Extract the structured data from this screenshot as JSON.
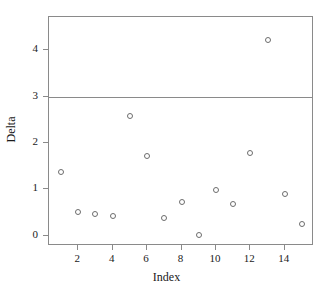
{
  "chart_data": {
    "type": "scatter",
    "title": "",
    "xlabel": "Index",
    "ylabel": "Delta",
    "xlim": [
      0.3,
      15.7
    ],
    "ylim": [
      -0.22,
      4.72
    ],
    "grid": false,
    "legend": null,
    "xticks": [
      2,
      4,
      6,
      8,
      10,
      12,
      14
    ],
    "xtick_labels": [
      "2",
      "4",
      "6",
      "8",
      "10",
      "12",
      "14"
    ],
    "yticks": [
      0,
      1,
      2,
      3,
      4
    ],
    "ytick_labels": [
      "0",
      "1",
      "2",
      "3",
      "4"
    ],
    "marker": "open-circle",
    "marker_color": "#6d6d6d",
    "frame_color": "#8a8a8a",
    "reference_lines": [
      {
        "axis": "y",
        "value": 3,
        "color": "#8a8a8a",
        "label": ""
      }
    ],
    "x": [
      1,
      2,
      3,
      4,
      5,
      6,
      7,
      8,
      9,
      10,
      11,
      12,
      13,
      14,
      15
    ],
    "y": [
      1.38,
      0.51,
      0.47,
      0.42,
      2.59,
      1.72,
      0.38,
      0.72,
      0.02,
      0.98,
      0.68,
      1.78,
      4.22,
      0.91,
      0.26
    ],
    "points": [
      {
        "x": 1,
        "y": 1.38
      },
      {
        "x": 2,
        "y": 0.51
      },
      {
        "x": 3,
        "y": 0.47
      },
      {
        "x": 4,
        "y": 0.42
      },
      {
        "x": 5,
        "y": 2.59
      },
      {
        "x": 6,
        "y": 1.72
      },
      {
        "x": 7,
        "y": 0.38
      },
      {
        "x": 8,
        "y": 0.72
      },
      {
        "x": 9,
        "y": 0.02
      },
      {
        "x": 10,
        "y": 0.98
      },
      {
        "x": 11,
        "y": 0.68
      },
      {
        "x": 12,
        "y": 1.78
      },
      {
        "x": 13,
        "y": 4.22
      },
      {
        "x": 14,
        "y": 0.91
      },
      {
        "x": 15,
        "y": 0.26
      }
    ]
  }
}
